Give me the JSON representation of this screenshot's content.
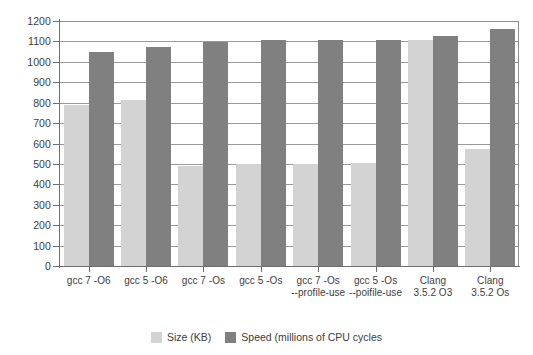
{
  "chart_data": {
    "type": "bar",
    "title": "",
    "subtitle": "",
    "xlabel": "",
    "ylabel": "",
    "ylim": [
      0,
      1200
    ],
    "ytick_step": 100,
    "yticks": [
      0,
      100,
      200,
      300,
      400,
      500,
      600,
      700,
      800,
      900,
      1000,
      1100,
      1200
    ],
    "ytick_labels": [
      "0",
      "100",
      "200",
      "300",
      "400",
      "500",
      "600",
      "700",
      "800",
      "900",
      "1000",
      "1100",
      "1200"
    ],
    "grid": true,
    "grid_axis": "y",
    "legend_position": "bottom-center",
    "categories": [
      "gcc 7 -O6",
      "gcc 5 -O6",
      "gcc 7 -Os",
      "gcc 5 -Os",
      "gcc 7 -Os --profile-use",
      "gcc 5 -Os --poifile-use",
      "Clang 3.5.2 O3",
      "Clang 3.5.2 Os"
    ],
    "category_label_lines": [
      [
        "gcc 7 -O6"
      ],
      [
        "gcc 5 -O6"
      ],
      [
        "gcc 7 -Os"
      ],
      [
        "gcc 5 -Os"
      ],
      [
        "gcc 7 -Os",
        "--profile-use"
      ],
      [
        "gcc 5 -Os",
        "--poifile-use"
      ],
      [
        "Clang",
        "3.5.2 O3"
      ],
      [
        "Clang",
        "3.5.2 Os"
      ]
    ],
    "series": [
      {
        "name": "Size (KB)",
        "color": "#d3d3d3",
        "values": [
          787,
          812,
          490,
          500,
          500,
          505,
          1105,
          575
        ]
      },
      {
        "name": "Speed (millions of CPU cycles",
        "color": "#808080",
        "values": [
          1050,
          1072,
          1095,
          1105,
          1105,
          1105,
          1128,
          1160
        ]
      }
    ]
  },
  "legend": {
    "items": [
      {
        "label": "Size (KB)",
        "color": "#d3d3d3"
      },
      {
        "label": "Speed (millions of CPU cycles",
        "color": "#808080"
      }
    ]
  },
  "colors": {
    "size_series": "#d3d3d3",
    "speed_series": "#808080",
    "gridline": "#9a9a9a",
    "axis": "#6e6e6e",
    "text": "#3d3d3d",
    "background": "#ffffff"
  }
}
